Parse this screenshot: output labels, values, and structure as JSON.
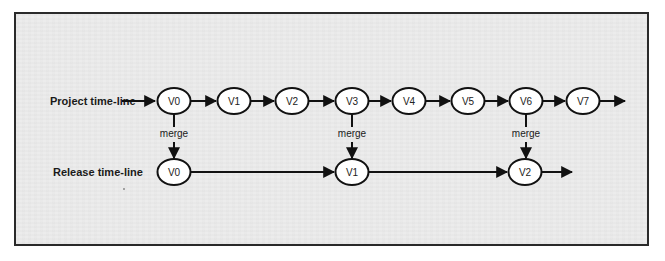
{
  "diagram": {
    "project_label": "Project time-line",
    "release_label": "Release time-line",
    "merge_label": "merge",
    "project_nodes": [
      {
        "label": "V0",
        "cx": 174
      },
      {
        "label": "V1",
        "cx": 234
      },
      {
        "label": "V2",
        "cx": 292
      },
      {
        "label": "V3",
        "cx": 352
      },
      {
        "label": "V4",
        "cx": 409
      },
      {
        "label": "V5",
        "cx": 468
      },
      {
        "label": "V6",
        "cx": 526
      },
      {
        "label": "V7",
        "cx": 583
      }
    ],
    "release_nodes": [
      {
        "label": "V0",
        "cx": 174
      },
      {
        "label": "V1",
        "cx": 352
      },
      {
        "label": "V2",
        "cx": 525
      }
    ],
    "merges": [
      {
        "from": "Project V0",
        "to": "Release V0",
        "label": "merge"
      },
      {
        "from": "Project V3",
        "to": "Release V1",
        "label": "merge"
      },
      {
        "from": "Project V6",
        "to": "Release V2",
        "label": "merge"
      }
    ],
    "colors": {
      "stroke": "#111111",
      "node_fill": "#ffffff",
      "background": "#ececec"
    }
  }
}
